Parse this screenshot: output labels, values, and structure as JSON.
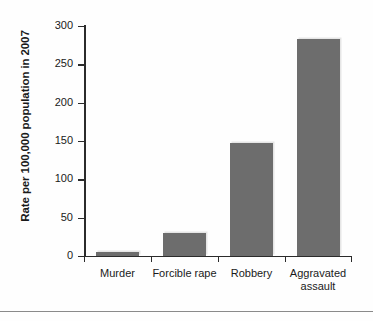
{
  "chart_data": {
    "type": "bar",
    "title": "",
    "xlabel": "",
    "ylabel": "Rate per 100,000 population in 2007",
    "categories": [
      "Murder",
      "Forcible rape",
      "Robbery",
      "Aggravated assault"
    ],
    "values": [
      5,
      30,
      148,
      283
    ],
    "ylim": [
      0,
      300
    ],
    "yticks": [
      0,
      50,
      100,
      150,
      200,
      250,
      300
    ],
    "ytick_labels": [
      "0",
      "50",
      "100",
      "150",
      "200",
      "250",
      "300"
    ],
    "grid": false,
    "legend": null,
    "series": [
      {
        "name": "Rate per 100,000 population in 2007",
        "values": [
          5,
          30,
          148,
          283
        ]
      }
    ],
    "colors": {
      "bar_fill": "#6d6d6d",
      "bar_highlight": "#e6e6e6",
      "axis": "#2b2b2b",
      "text": "#1a1a1a",
      "background": "#fefefe"
    }
  },
  "category_lines": {
    "0": [
      "Murder"
    ],
    "1": [
      "Forcible rape"
    ],
    "2": [
      "Robbery"
    ],
    "3": [
      "Aggravated",
      "assault"
    ]
  },
  "labels": {
    "cat0": "Murder",
    "cat1": "Forcible rape",
    "cat2": "Robbery",
    "cat3_line1": "Aggravated",
    "cat3_line2": "assault",
    "y0": "0",
    "y50": "50",
    "y100": "100",
    "y150": "150",
    "y200": "200",
    "y250": "250",
    "y300": "300",
    "axis_title": "Rate per 100,000 population in 2007"
  }
}
